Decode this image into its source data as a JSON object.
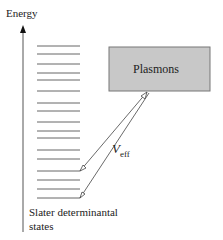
{
  "axis": {
    "label": "Energy"
  },
  "box": {
    "label": "Plasmons",
    "fill": "#c8c8c8"
  },
  "coupling": {
    "symbol": "V",
    "subscript": "eff"
  },
  "states": {
    "label_line1": "Slater determinantal",
    "label_line2": "states"
  },
  "level_y": [
    46,
    54,
    64,
    73,
    80,
    91,
    103,
    111,
    122,
    131,
    138,
    150,
    159,
    171,
    180,
    189,
    198
  ]
}
